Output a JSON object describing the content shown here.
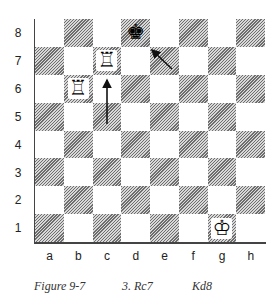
{
  "board": {
    "ranks": [
      "8",
      "7",
      "6",
      "5",
      "4",
      "3",
      "2",
      "1"
    ],
    "files": [
      "a",
      "b",
      "c",
      "d",
      "e",
      "f",
      "g",
      "h"
    ],
    "pieces": {
      "d8": {
        "glyph": "♚",
        "name": "black-king"
      },
      "c7": {
        "glyph": "♖",
        "name": "white-rook"
      },
      "b6": {
        "glyph": "♖",
        "name": "white-rook"
      },
      "g1": {
        "glyph": "♔",
        "name": "white-king"
      }
    },
    "arrows": [
      {
        "from": "c5",
        "to": "c7",
        "label": "rook move arrow"
      },
      {
        "from": "e7",
        "to": "d8",
        "label": "king move arrow"
      }
    ]
  },
  "caption": {
    "figure": "Figure 9-7",
    "move_white": "3. Rc7",
    "move_black": "Kd8"
  }
}
